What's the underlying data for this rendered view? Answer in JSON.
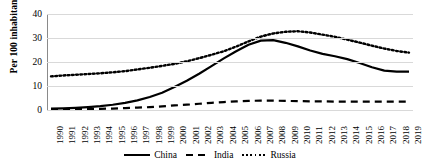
{
  "chart_data": {
    "type": "line",
    "title": "",
    "xlabel": "",
    "ylabel": "Per 100 inhabitants",
    "ylim": [
      0,
      40
    ],
    "yticks": [
      0,
      10,
      20,
      30,
      40
    ],
    "grid": true,
    "legend_position": "bottom",
    "x": [
      1990,
      1991,
      1992,
      1993,
      1994,
      1995,
      1996,
      1997,
      1998,
      1999,
      2000,
      2001,
      2002,
      2003,
      2004,
      2005,
      2006,
      2007,
      2008,
      2009,
      2010,
      2011,
      2012,
      2013,
      2014,
      2015,
      2016,
      2017,
      2018,
      2019
    ],
    "categories": [
      "1990",
      "1991",
      "1992",
      "1993",
      "1994",
      "1995",
      "1996",
      "1997",
      "1998",
      "1999",
      "2000",
      "2001",
      "2002",
      "2003",
      "2004",
      "2005",
      "2006",
      "2007",
      "2008",
      "2009",
      "2010",
      "2011",
      "2012",
      "2013",
      "2014",
      "2015",
      "2016",
      "2017",
      "2018",
      "2019"
    ],
    "series": [
      {
        "name": "China",
        "style": "solid",
        "color": "#000000",
        "values": [
          0.6,
          0.7,
          0.9,
          1.2,
          1.6,
          2.2,
          3.0,
          4.0,
          5.4,
          7.2,
          9.6,
          12.2,
          15.1,
          18.3,
          21.5,
          24.5,
          27.2,
          28.9,
          29.1,
          28.0,
          26.5,
          24.8,
          23.4,
          22.4,
          21.2,
          19.6,
          17.8,
          16.4,
          16.0,
          16.0
        ]
      },
      {
        "name": "India",
        "style": "dashed",
        "color": "#000000",
        "values": [
          0.3,
          0.3,
          0.4,
          0.4,
          0.5,
          0.6,
          0.8,
          1.0,
          1.2,
          1.5,
          1.9,
          2.2,
          2.6,
          3.0,
          3.3,
          3.6,
          3.8,
          3.9,
          3.9,
          3.8,
          3.7,
          3.6,
          3.6,
          3.5,
          3.5,
          3.5,
          3.5,
          3.5,
          3.5,
          3.5
        ]
      },
      {
        "name": "Russia",
        "style": "dotted",
        "color": "#000000",
        "values": [
          14.0,
          14.4,
          14.7,
          15.0,
          15.3,
          15.7,
          16.2,
          16.9,
          17.6,
          18.4,
          19.2,
          20.3,
          21.6,
          23.0,
          24.5,
          26.4,
          28.6,
          30.6,
          31.9,
          32.6,
          32.8,
          32.3,
          31.4,
          30.5,
          29.3,
          28.1,
          26.8,
          25.6,
          24.6,
          23.9
        ]
      }
    ]
  },
  "legend": {
    "items": [
      {
        "label": "China"
      },
      {
        "label": "India"
      },
      {
        "label": "Russia"
      }
    ]
  }
}
